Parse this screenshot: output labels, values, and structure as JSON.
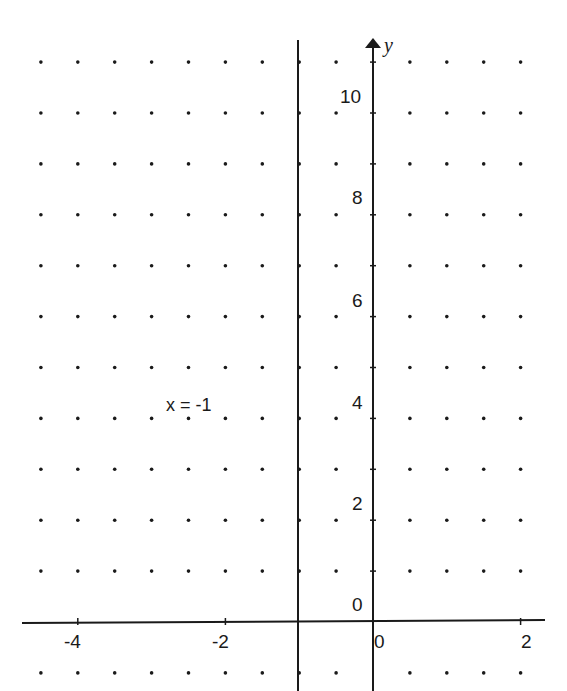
{
  "chart_data": {
    "type": "line",
    "title": "",
    "xlabel": "",
    "ylabel": "y",
    "xlim": [
      -4.5,
      2.3
    ],
    "ylim": [
      -1,
      11
    ],
    "grid": "dots",
    "grid_step_x": 0.5,
    "grid_step_y": 1,
    "x_ticks": [
      -4,
      -2,
      0,
      2
    ],
    "x_tick_labels": [
      "-4",
      "-2",
      "0",
      "2"
    ],
    "y_ticks": [
      0,
      2,
      4,
      6,
      8,
      10
    ],
    "y_tick_labels": [
      "0",
      "2",
      "4",
      "6",
      "8",
      "10"
    ],
    "series": [
      {
        "name": "x = -1",
        "kind": "vertical_line",
        "x": -1,
        "y_range": [
          -1,
          11
        ]
      }
    ],
    "annotations": [
      {
        "text": "x = -1",
        "x": -2.7,
        "y": 4
      }
    ]
  },
  "labels": {
    "y_axis": "y",
    "line_equation": "x = -1",
    "x_ticks": [
      "-4",
      "-2",
      "0",
      "2"
    ],
    "y_ticks": [
      "10",
      "8",
      "6",
      "4",
      "2",
      "0"
    ]
  },
  "colors": {
    "ink": "#1a1a1a",
    "background": "#ffffff"
  }
}
